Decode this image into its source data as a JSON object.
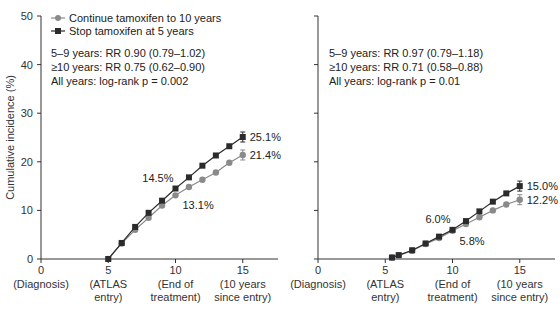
{
  "chart_data": [
    {
      "type": "line",
      "panel": "left",
      "title": "",
      "xlabel": "",
      "ylabel": "Cumulative incidence (%)",
      "ylim": [
        0,
        50
      ],
      "xlim": [
        0,
        17
      ],
      "yticks": [
        0,
        10,
        20,
        30,
        40,
        50
      ],
      "xticks": [
        {
          "value": 0,
          "label": "0",
          "sub": [
            "(Diagnosis)"
          ]
        },
        {
          "value": 5,
          "label": "5",
          "sub": [
            "(ATLAS",
            "entry)"
          ]
        },
        {
          "value": 10,
          "label": "10",
          "sub": [
            "(End of",
            "treatment)"
          ]
        },
        {
          "value": 15,
          "label": "15",
          "sub": [
            "(10 years",
            "since entry)"
          ]
        }
      ],
      "legend": [
        {
          "name": "Continue tamoxifen to 10 years",
          "marker": "circle",
          "color": "#8a8a8a"
        },
        {
          "name": "Stop tamoxifen at 5 years",
          "marker": "square",
          "color": "#2b2b2b"
        }
      ],
      "stats": [
        "5–9 years: RR 0.90 (0.79–1.02)",
        "≥10 years: RR 0.75 (0.62–0.90)",
        "All years: log-rank p = 0.002"
      ],
      "series": [
        {
          "name": "Stop tamoxifen at 5 years",
          "x": [
            5,
            6,
            7,
            8,
            9,
            10,
            11,
            12,
            13,
            14,
            15
          ],
          "values": [
            0,
            3.3,
            6.6,
            9.5,
            12.0,
            14.5,
            16.8,
            19.2,
            21.3,
            23.2,
            25.1
          ]
        },
        {
          "name": "Continue tamoxifen to 10 years",
          "x": [
            5,
            6,
            7,
            8,
            9,
            10,
            11,
            12,
            13,
            14,
            15
          ],
          "values": [
            0,
            3.2,
            6.0,
            8.5,
            11.0,
            13.1,
            14.8,
            16.3,
            17.8,
            19.8,
            21.4
          ]
        }
      ],
      "annotations": [
        {
          "text": "14.5%",
          "x": 10,
          "y": 14.5,
          "series": "stop"
        },
        {
          "text": "13.1%",
          "x": 10,
          "y": 13.1,
          "series": "continue"
        },
        {
          "text": "25.1%",
          "x": 15,
          "y": 25.1,
          "series": "stop"
        },
        {
          "text": "21.4%",
          "x": 15,
          "y": 21.4,
          "series": "continue"
        }
      ]
    },
    {
      "type": "line",
      "panel": "right",
      "title": "",
      "xlabel": "",
      "ylabel": "",
      "ylim": [
        0,
        50
      ],
      "xlim": [
        0,
        17
      ],
      "yticks": [
        0,
        10,
        20,
        30,
        40,
        50
      ],
      "xticks": [
        {
          "value": 0,
          "label": "0",
          "sub": [
            "(Diagnosis)"
          ]
        },
        {
          "value": 5,
          "label": "5",
          "sub": [
            "(ATLAS",
            "entry)"
          ]
        },
        {
          "value": 10,
          "label": "10",
          "sub": [
            "(End of",
            "treatment)"
          ]
        },
        {
          "value": 15,
          "label": "15",
          "sub": [
            "(10 years",
            "since entry)"
          ]
        }
      ],
      "stats": [
        "5–9 years: RR 0.97 (0.79–1.18)",
        "≥10 years: RR 0.71 (0.58–0.88)",
        "All years: log-rank p = 0.01"
      ],
      "series": [
        {
          "name": "Stop tamoxifen at 5 years",
          "x": [
            5.5,
            6,
            7,
            8,
            9,
            10,
            11,
            12,
            13,
            14,
            15
          ],
          "values": [
            0.3,
            0.8,
            1.8,
            3.2,
            4.6,
            6.0,
            7.8,
            9.8,
            11.8,
            13.5,
            15.0
          ]
        },
        {
          "name": "Continue tamoxifen to 10 years",
          "x": [
            5.5,
            6,
            7,
            8,
            9,
            10,
            11,
            12,
            13,
            14,
            15
          ],
          "values": [
            0.3,
            0.7,
            1.7,
            3.1,
            4.3,
            5.8,
            7.2,
            8.6,
            10.0,
            11.2,
            12.2
          ]
        }
      ],
      "annotations": [
        {
          "text": "6.0%",
          "x": 10,
          "y": 6.0,
          "series": "stop"
        },
        {
          "text": "5.8%",
          "x": 10,
          "y": 5.8,
          "series": "continue"
        },
        {
          "text": "15.0%",
          "x": 15,
          "y": 15.0,
          "series": "stop"
        },
        {
          "text": "12.2%",
          "x": 15,
          "y": 12.2,
          "series": "continue"
        }
      ]
    }
  ]
}
